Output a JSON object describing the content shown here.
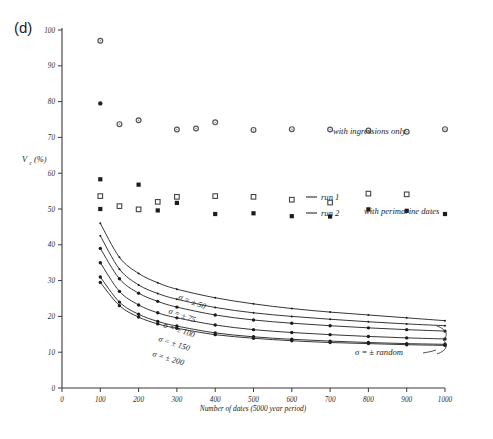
{
  "figure": {
    "panel_label": "(d)",
    "background": "#ffffff",
    "ink_color": "#2b2b2b"
  },
  "chart_data": {
    "type": "scatter",
    "title": "",
    "subtitle": "",
    "xlabel": "Number of dates (5000 year period)",
    "ylabel": "V_c (%)",
    "ylabel_main": "V",
    "ylabel_subscript": "c",
    "ylabel_units": "(%)",
    "xlim": [
      0,
      1000
    ],
    "ylim": [
      0,
      100
    ],
    "xticks": [
      0,
      100,
      200,
      300,
      400,
      500,
      600,
      700,
      800,
      900,
      1000
    ],
    "yticks": [
      0,
      10,
      20,
      30,
      40,
      50,
      60,
      70,
      80,
      90,
      100
    ],
    "xtick_labels": [
      "0",
      "100",
      "200",
      "300",
      "400",
      "500",
      "600",
      "700",
      "800",
      "900",
      "1000"
    ],
    "ytick_labels": [
      "0",
      "10",
      "20",
      "30",
      "40",
      "50",
      "60",
      "70",
      "80",
      "90",
      "100"
    ],
    "grid": false,
    "legend_position": "right-inside",
    "annotations": [
      {
        "name": "with-ingressions-only",
        "text": "with ingressions only",
        "x": 760,
        "y": 72
      },
      {
        "name": "with-perimarine-dates",
        "text": "with perimarine dates",
        "x": 810,
        "y": 48
      },
      {
        "name": "sigma-random",
        "text": "σ = ± random",
        "x": 690,
        "y": 10
      }
    ],
    "legend": [
      {
        "name": "run-1",
        "label": "run 1",
        "marker": "open-square",
        "dash": "line"
      },
      {
        "name": "run-2",
        "label": "run 2",
        "marker": "filled-square",
        "dash": "line"
      }
    ],
    "curve_labels": [
      {
        "name": "sigma-50",
        "text": "σ = ± 50"
      },
      {
        "name": "sigma-75",
        "text": "σ = ± 75"
      },
      {
        "name": "sigma-100",
        "text": "σ = ± 100"
      },
      {
        "name": "sigma-150",
        "text": "σ = ± 150"
      },
      {
        "name": "sigma-200",
        "text": "σ = ± 200"
      }
    ],
    "series": [
      {
        "name": "ingressions-run1",
        "label": "with ingressions only (run 1)",
        "marker": "open-circle",
        "x": [
          100,
          150,
          200,
          300,
          350,
          400,
          500,
          600,
          700,
          800,
          900,
          1000
        ],
        "y": [
          97.0,
          73.7,
          74.8,
          72.2,
          72.5,
          74.2,
          72.1,
          72.3,
          72.2,
          71.9,
          71.6,
          72.3
        ]
      },
      {
        "name": "ingressions-run2",
        "label": "with ingressions only (run 2)",
        "marker": "filled-circle",
        "x": [
          100
        ],
        "y": [
          79.5
        ]
      },
      {
        "name": "perimarine-run1",
        "label": "with perimarine dates (run 1)",
        "marker": "open-square",
        "x": [
          100,
          150,
          200,
          250,
          300,
          400,
          500,
          600,
          700,
          800,
          900
        ],
        "y": [
          53.6,
          50.8,
          49.9,
          52.0,
          53.4,
          53.6,
          53.4,
          52.6,
          51.8,
          54.3,
          54.1
        ]
      },
      {
        "name": "perimarine-run2",
        "label": "with perimarine dates (run 2)",
        "marker": "filled-square",
        "x": [
          100,
          100,
          200,
          250,
          300,
          400,
          500,
          600,
          700,
          800,
          900,
          1000
        ],
        "y": [
          58.3,
          50.0,
          56.8,
          49.6,
          51.7,
          48.6,
          48.8,
          48.0,
          47.9,
          49.9,
          49.5,
          48.6
        ]
      },
      {
        "name": "sigma-50-curve",
        "label": "σ = ± 50",
        "marker": "dot",
        "x": [
          100,
          150,
          200,
          250,
          300,
          400,
          500,
          600,
          700,
          800,
          900,
          1000
        ],
        "y": [
          46.0,
          36.5,
          32.0,
          29.4,
          27.6,
          25.2,
          23.5,
          22.2,
          21.2,
          20.4,
          19.6,
          18.8
        ]
      },
      {
        "name": "sigma-75-curve",
        "label": "σ = ± 75",
        "marker": "dot",
        "x": [
          100,
          150,
          200,
          250,
          300,
          400,
          500,
          600,
          700,
          800,
          900,
          1000
        ],
        "y": [
          42.5,
          33.2,
          28.8,
          26.4,
          24.8,
          22.5,
          21.0,
          20.0,
          19.2,
          18.5,
          17.9,
          17.4
        ]
      },
      {
        "name": "sigma-100-curve",
        "label": "σ = ± 100",
        "marker": "filled-circle-small",
        "x": [
          100,
          150,
          200,
          250,
          300,
          400,
          500,
          600,
          700,
          800,
          900,
          1000
        ],
        "y": [
          39.0,
          30.5,
          26.5,
          24.2,
          22.6,
          20.4,
          19.0,
          18.1,
          17.4,
          16.8,
          16.3,
          15.9
        ]
      },
      {
        "name": "sigma-150-curve",
        "label": "σ = ± 150",
        "marker": "filled-circle-small",
        "x": [
          100,
          150,
          200,
          250,
          300,
          400,
          500,
          600,
          700,
          800,
          900,
          1000
        ],
        "y": [
          35.0,
          27.0,
          23.2,
          21.0,
          19.6,
          17.6,
          16.3,
          15.5,
          14.9,
          14.4,
          14.0,
          13.7
        ]
      },
      {
        "name": "sigma-200-curve",
        "label": "σ = ± 200",
        "marker": "filled-circle-small",
        "x": [
          100,
          150,
          200,
          250,
          300,
          400,
          500,
          600,
          700,
          800,
          900,
          1000
        ],
        "y": [
          31.0,
          24.0,
          20.6,
          18.6,
          17.3,
          15.4,
          14.3,
          13.6,
          13.1,
          12.7,
          12.4,
          12.2
        ]
      },
      {
        "name": "sigma-random-curve",
        "label": "σ = ± random",
        "marker": "filled-circle-small",
        "x": [
          100,
          150,
          200,
          250,
          300,
          400,
          500,
          600,
          700,
          800,
          900,
          1000
        ],
        "y": [
          29.5,
          23.0,
          19.8,
          17.9,
          16.7,
          14.9,
          13.9,
          13.2,
          12.7,
          12.4,
          12.1,
          11.9
        ]
      }
    ]
  }
}
